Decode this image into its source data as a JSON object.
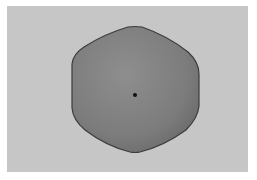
{
  "image": {
    "description": "Grayscale photograph of a rounded hexagonal gray object with a small dark dot at its center, on a light gray background with a white border",
    "colors": {
      "border": "#ffffff",
      "background": "#c6c6c6",
      "shape_fill_light": "#8c8c8c",
      "shape_fill_dark": "#6e6e6e",
      "shape_outline": "#3c3c3c",
      "center_dot": "#111111"
    },
    "shape": {
      "kind": "rounded-hexagon",
      "center": [
        135,
        92
      ],
      "width": 128,
      "height": 126
    },
    "center_dot": {
      "x": 135,
      "y": 95,
      "radius": 2
    }
  }
}
